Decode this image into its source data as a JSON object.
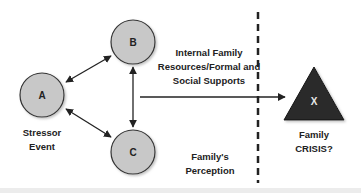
{
  "diagram": {
    "type": "ABC-X family stress model",
    "nodes": [
      {
        "id": "A",
        "label": "A",
        "caption": [
          "Stressor",
          "Event"
        ]
      },
      {
        "id": "B",
        "label": "B",
        "caption": [
          "Internal Family",
          "Resources/Formal and",
          "Social Supports"
        ]
      },
      {
        "id": "C",
        "label": "C",
        "caption": [
          "Family's",
          "Perception"
        ]
      },
      {
        "id": "X",
        "label": "X",
        "caption": [
          "Family",
          "CRISIS?"
        ]
      }
    ],
    "edges": [
      {
        "from": "A",
        "to": "B",
        "bidirectional": true
      },
      {
        "from": "A",
        "to": "C",
        "bidirectional": true
      },
      {
        "from": "B",
        "to": "C",
        "bidirectional": true
      },
      {
        "from": "B-C",
        "to": "X",
        "bidirectional": false
      }
    ],
    "colors": {
      "circle_fill": "#c8c8c8",
      "circle_stroke": "#333333",
      "triangle_fill": "#2a2a2a",
      "line": "#222222"
    }
  }
}
